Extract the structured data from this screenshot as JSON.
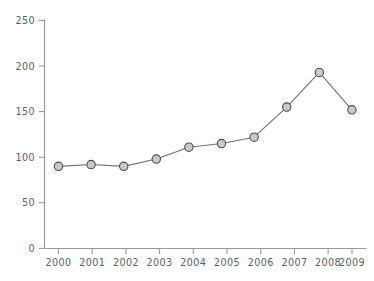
{
  "chart_data": {
    "type": "line",
    "title": "",
    "subtitle": "",
    "xlabel": "",
    "ylabel": "",
    "categories": [
      "2000",
      "2001",
      "2002",
      "2003",
      "2004",
      "2005",
      "2006",
      "2007",
      "2008",
      "2009"
    ],
    "values": [
      90,
      92,
      90,
      98,
      111,
      115,
      122,
      155,
      193,
      152
    ],
    "series": [
      {
        "name": "",
        "values": [
          90,
          92,
          90,
          98,
          111,
          115,
          122,
          155,
          193,
          152
        ]
      }
    ],
    "ylim": [
      0,
      250
    ],
    "y_ticks": [
      0,
      50,
      100,
      150,
      200,
      250
    ],
    "y_tick_labels": [
      "0",
      "50",
      "100",
      "150",
      "200",
      "250"
    ],
    "x_tick_labels": [
      "2000",
      "2001",
      "2002",
      "2003",
      "2004",
      "2005",
      "2006",
      "2007",
      "2008",
      "2009"
    ],
    "grid": false,
    "legend": false,
    "legend_position": "none",
    "annotations": [],
    "colors": {
      "line": "#6e6e6e",
      "marker_fill": "#c9c9c9",
      "marker_stroke": "#4f4f4f",
      "axis": "#9a9a9a",
      "tick_label": "#58606b",
      "background": "#ffffff"
    },
    "marker": "circle"
  }
}
